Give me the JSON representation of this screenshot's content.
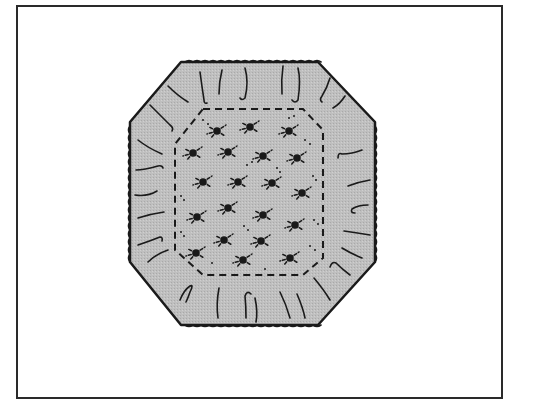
{
  "figure": {
    "colors": {
      "background": "#ffffff",
      "frame": "#2a2a2a",
      "fill": "#bdbdbd",
      "ink": "#1a1a1a"
    },
    "motif_count": 20
  }
}
